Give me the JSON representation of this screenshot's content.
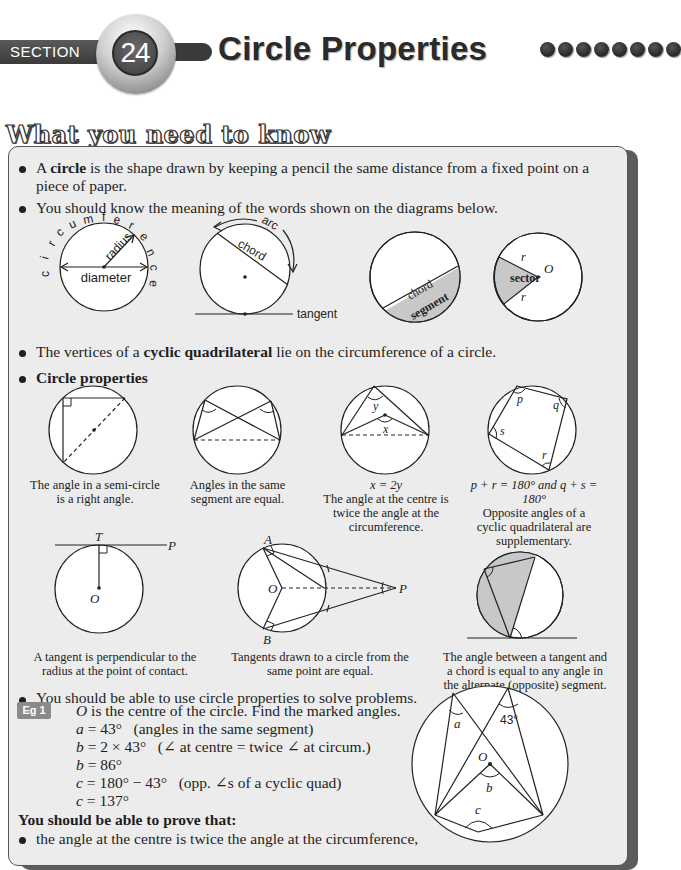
{
  "header": {
    "section_label": "SECTION",
    "section_number": "24",
    "title": "Circle Properties",
    "dots_count": 8
  },
  "subheading": "What you need to know",
  "bullets": {
    "circle_def_pre": "A ",
    "circle_def_bold": "circle",
    "circle_def_post_line1": " is the shape drawn by keeping a pencil the same distance from a fixed point on a",
    "circle_def_line2": "piece of paper.",
    "know_words": "You should know the meaning of the words shown on the diagrams below.",
    "cyclic_pre": "The vertices of a ",
    "cyclic_bold": "cyclic quadrilateral",
    "cyclic_post": " lie on the circumference of a circle.",
    "properties_heading": "Circle properties",
    "use_properties": "You should be able to use circle properties to solve problems."
  },
  "vocab_diagrams": {
    "circumference_letters": [
      "c",
      "i",
      "r",
      "c",
      "u",
      "m",
      "f",
      "e",
      "r",
      "e",
      "n",
      "c",
      "e"
    ],
    "radius": "radius",
    "diameter": "diameter",
    "arc": "arc",
    "chord": "chord",
    "tangent": "tangent",
    "chord2": "chord",
    "segment": "segment",
    "sector": "sector",
    "r1": "r",
    "r2": "r",
    "O": "O"
  },
  "properties": [
    {
      "caption_line1": "The angle in a semi-circle",
      "caption_line2": "is a right angle."
    },
    {
      "caption_line1": "Angles in the same",
      "caption_line2": "segment are equal."
    },
    {
      "formula": "x = 2y",
      "caption_line1": "The angle at the centre is",
      "caption_line2": "twice the angle at the",
      "caption_line3": "circumference.",
      "label_x": "x",
      "label_y": "y"
    },
    {
      "formula": "p + r = 180° and q + s = 180°",
      "caption_line1": "Opposite angles of a",
      "caption_line2": "cyclic quadrilateral are",
      "caption_line3": "supplementary.",
      "label_p": "p",
      "label_q": "q",
      "label_r": "r",
      "label_s": "s"
    },
    {
      "caption_line1": "A tangent is perpendicular to the",
      "caption_line2": "radius at the point of contact.",
      "label_T": "T",
      "label_P": "P",
      "label_O": "O"
    },
    {
      "caption_line1": "Tangents drawn to a circle from the",
      "caption_line2": "same point are equal.",
      "label_A": "A",
      "label_B": "B",
      "label_O": "O",
      "label_P": "P"
    },
    {
      "caption_line1": "The angle between a tangent and",
      "caption_line2": "a chord is equal to any angle in",
      "caption_line3": "the alternate (opposite) segment."
    }
  ],
  "example": {
    "badge": "Eg 1",
    "question_var": "O",
    "question": " is the centre of the circle. Find the marked angles.",
    "lines": [
      {
        "lhs": "a",
        "rhs": " = 43°",
        "reason": "(angles in the same segment)"
      },
      {
        "lhs": "b",
        "rhs": " = 2 × 43°",
        "reason": "(∠ at centre = twice ∠ at circum.)"
      },
      {
        "lhs": "b",
        "rhs": " = 86°",
        "reason": ""
      },
      {
        "lhs": "c",
        "rhs": " = 180° − 43°",
        "reason": "(opp. ∠s of a cyclic quad)"
      },
      {
        "lhs": "c",
        "rhs": " = 137°",
        "reason": ""
      }
    ],
    "diagram": {
      "a": "a",
      "angle": "43°",
      "O": "O",
      "b": "b",
      "c": "c"
    }
  },
  "prove": {
    "heading": "You should be able to prove that:",
    "items": [
      "the angle at the centre is twice the angle at the circumference,"
    ]
  }
}
